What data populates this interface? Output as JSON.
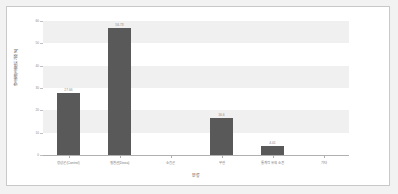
{
  "chart_data": {
    "type": "bar",
    "title": "",
    "xlabel": "분류",
    "ylabel": "총사용량(사용빈도 기준 %)",
    "categories": [
      "정상군(Control)",
      "질환군(Disea)",
      "소음군",
      "무관",
      "통계적 유의 소견",
      "기타"
    ],
    "values": [
      27.66,
      56.73,
      0,
      16.6,
      4.01,
      0
    ],
    "value_labels": [
      "27.66",
      "56.73",
      "",
      "16.6",
      "4.01",
      ""
    ],
    "ylim": [
      0,
      60
    ],
    "yticks": [
      0,
      10,
      20,
      30,
      40,
      50,
      60
    ],
    "ytick_labels": [
      "0",
      "10",
      "20",
      "30",
      "40",
      "50",
      "60"
    ],
    "grid": "horizontal-bands",
    "legend": "none",
    "bar_color": "#595959"
  },
  "style": {
    "page_background": "#f2f2f2",
    "card_background": "#ffffff",
    "card_border": "#c8c8c8",
    "band_color": "#f0f0f0",
    "axis_color": "#b0b0b0",
    "text_color": "#7a7a7a"
  }
}
